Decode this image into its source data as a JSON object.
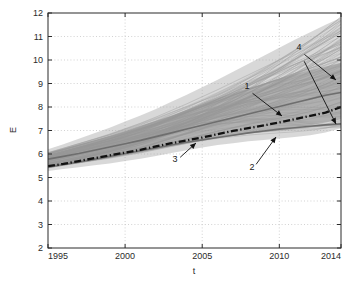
{
  "chart_data": {
    "type": "line",
    "title": "",
    "xlabel": "t",
    "ylabel": "E",
    "xlim": [
      1995,
      2014
    ],
    "ylim": [
      2,
      12
    ],
    "grid": true,
    "grid_style": "dotted",
    "legend": "none",
    "x_ticks": [
      1995,
      2000,
      2005,
      2010,
      2014
    ],
    "y_ticks": [
      2,
      3,
      4,
      5,
      6,
      7,
      8,
      9,
      10,
      11,
      12
    ],
    "x": [
      1995,
      1996,
      1997,
      1998,
      1999,
      2000,
      2001,
      2002,
      2003,
      2004,
      2005,
      2006,
      2007,
      2008,
      2009,
      2010,
      2011,
      2012,
      2013,
      2014
    ],
    "series": [
      {
        "name": "ensemble-upper-envelope",
        "role": "band-upper",
        "color": "#9a9a9a",
        "values": [
          6.2,
          6.42,
          6.65,
          6.88,
          7.12,
          7.38,
          7.64,
          7.92,
          8.22,
          8.52,
          8.84,
          9.16,
          9.5,
          9.84,
          10.18,
          10.52,
          10.86,
          11.18,
          11.5,
          11.8
        ]
      },
      {
        "name": "ensemble-lower-envelope",
        "role": "band-lower",
        "color": "#9a9a9a",
        "values": [
          5.28,
          5.36,
          5.44,
          5.52,
          5.6,
          5.7,
          5.8,
          5.92,
          6.04,
          6.16,
          6.28,
          6.38,
          6.46,
          6.54,
          6.6,
          6.66,
          6.72,
          6.8,
          6.92,
          7.1
        ]
      },
      {
        "name": "inner-band-upper",
        "role": "band-upper",
        "color": "#8c8c8c",
        "values": [
          6.05,
          6.22,
          6.4,
          6.58,
          6.78,
          6.98,
          7.2,
          7.42,
          7.64,
          7.88,
          8.12,
          8.36,
          8.58,
          8.8,
          9.0,
          9.2,
          9.38,
          9.56,
          9.72,
          9.88
        ]
      },
      {
        "name": "inner-band-lower",
        "role": "band-lower",
        "color": "#8c8c8c",
        "values": [
          5.42,
          5.52,
          5.62,
          5.72,
          5.84,
          5.96,
          6.08,
          6.2,
          6.34,
          6.46,
          6.58,
          6.68,
          6.78,
          6.88,
          6.96,
          7.04,
          7.12,
          7.22,
          7.34,
          7.48
        ]
      },
      {
        "name": "marker-1-upper-solid-line",
        "role": "solid-line",
        "color": "#6e6e6e",
        "values": [
          5.78,
          5.9,
          6.02,
          6.16,
          6.3,
          6.44,
          6.58,
          6.74,
          6.9,
          7.06,
          7.22,
          7.38,
          7.54,
          7.7,
          7.86,
          8.02,
          8.18,
          8.34,
          8.5,
          8.62
        ]
      },
      {
        "name": "marker-2-lower-solid-line",
        "role": "solid-line",
        "color": "#6e6e6e",
        "values": [
          5.45,
          5.55,
          5.66,
          5.78,
          5.9,
          6.02,
          6.14,
          6.26,
          6.38,
          6.5,
          6.6,
          6.7,
          6.8,
          6.9,
          6.98,
          7.06,
          7.12,
          7.18,
          7.24,
          7.28
        ]
      },
      {
        "name": "marker-3-dashdot-central-line",
        "role": "dashdot-line",
        "color": "#111111",
        "values": [
          5.48,
          5.58,
          5.7,
          5.82,
          5.94,
          6.06,
          6.18,
          6.32,
          6.46,
          6.58,
          6.7,
          6.84,
          6.98,
          7.1,
          7.22,
          7.34,
          7.48,
          7.62,
          7.76,
          8.0
        ]
      }
    ],
    "ensemble": {
      "name": "marker-4-ensemble-trajectories",
      "count": 120,
      "color": "#9e9e9e",
      "start_range": [
        5.3,
        6.2
      ],
      "end_range": [
        7.1,
        11.8
      ],
      "description": "spaghetti bundle of individual simulation trajectories"
    },
    "annotations": [
      {
        "label": "1",
        "text_x": 247,
        "text_y": 89,
        "arrow_to_x": 282,
        "arrow_to_y": 116
      },
      {
        "label": "2",
        "text_x": 252,
        "text_y": 170,
        "arrow_to_x": 276,
        "arrow_to_y": 137
      },
      {
        "label": "3",
        "text_x": 175,
        "text_y": 162,
        "arrow_to_x": 196,
        "arrow_to_y": 143
      },
      {
        "label": "4",
        "text_x": 299,
        "text_y": 50,
        "arrow_to_x": 336,
        "arrow_to_y": 80
      },
      {
        "label": "4b",
        "text_x": 301,
        "text_y": 55,
        "arrow_to_x": 336,
        "arrow_to_y": 124
      }
    ]
  },
  "figure": {
    "y_axis_label": "E",
    "x_axis_label": "t",
    "background_color": "#ffffff",
    "axis_color": "#2b2b2b",
    "grid_color": "#bfbfbf",
    "band_color": "#9a9a9a",
    "dashdot_color": "#111111"
  }
}
